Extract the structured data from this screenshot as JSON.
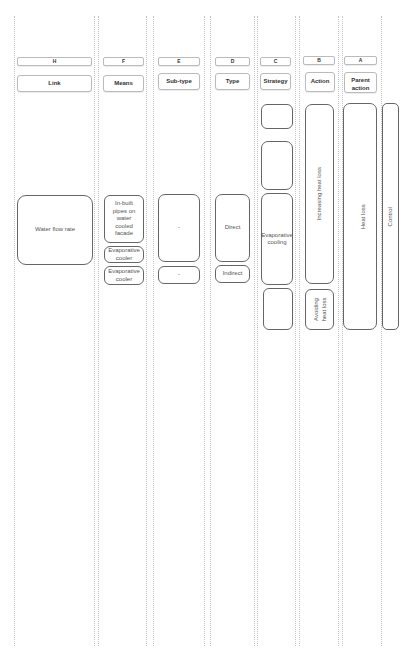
{
  "columns": [
    {
      "letter": "H",
      "label": "Link"
    },
    {
      "letter": "F",
      "label": "Means"
    },
    {
      "letter": "E",
      "label": "Sub-type"
    },
    {
      "letter": "D",
      "label": "Type"
    },
    {
      "letter": "C",
      "label": "Strategy"
    },
    {
      "letter": "B",
      "label": "Action"
    },
    {
      "letter": "A",
      "label": "Parent action"
    }
  ],
  "link": {
    "items": [
      "Water flow rate"
    ]
  },
  "means": {
    "items": [
      "In-built pipes on water cooled facade",
      "Evaporative cooler",
      "Evaporative cooler"
    ]
  },
  "subtype": {
    "items": [
      "-",
      "-"
    ]
  },
  "type": {
    "items": [
      "Direct",
      "Indirect"
    ]
  },
  "strategy": {
    "items": [
      "",
      "",
      "Evaporative cooling",
      ""
    ]
  },
  "action": {
    "items": [
      "Increasing heat loss",
      "Avoiding heat loss"
    ]
  },
  "parent_action": {
    "items": [
      "Heat loss"
    ]
  },
  "root": {
    "items": [
      "Control"
    ]
  },
  "colors": {
    "box_border": "#666666",
    "header_border": "#bbbbbb",
    "guide_line": "#c4c4c4",
    "text": "#555555"
  }
}
